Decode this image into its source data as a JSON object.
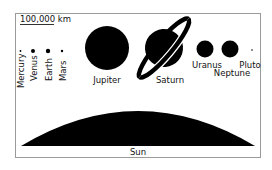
{
  "diagram": {
    "scale_bar": {
      "label": "100,000 km"
    },
    "colors": {
      "body": "#000000",
      "frame": "#9a9a9a",
      "background": "#ffffff",
      "text": "#111111"
    },
    "inner_planets": [
      {
        "name": "Mercury"
      },
      {
        "name": "Venus"
      },
      {
        "name": "Earth"
      },
      {
        "name": "Mars"
      }
    ],
    "outer_planets": [
      {
        "name": "Jupiter"
      },
      {
        "name": "Saturn"
      },
      {
        "name": "Uranus"
      },
      {
        "name": "Neptune"
      },
      {
        "name": "Pluto"
      }
    ],
    "sun": {
      "name": "Sun"
    }
  }
}
